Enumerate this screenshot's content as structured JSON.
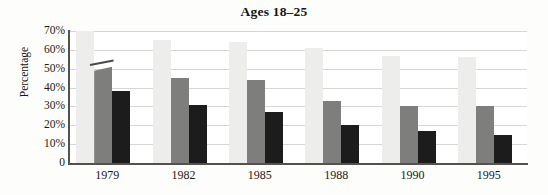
{
  "chart_data": {
    "type": "bar",
    "title": "Ages 18–25",
    "xlabel": "",
    "ylabel": "Percentage",
    "categories": [
      "1979",
      "1982",
      "1985",
      "1988",
      "1990",
      "1995"
    ],
    "ylim": [
      0,
      70
    ],
    "ytick_values": [
      70,
      60,
      50,
      40,
      30,
      20,
      10,
      0
    ],
    "ytick_labels": [
      "70%",
      "60%",
      "50%",
      "40%",
      "30%",
      "20%",
      "10%",
      "0"
    ],
    "grid": true,
    "legend": "none",
    "series": [
      {
        "name": "series-1",
        "color": "#ededeb",
        "values": [
          72,
          65,
          64,
          61,
          57,
          56
        ]
      },
      {
        "name": "series-2",
        "color": "#7e7e7c",
        "values": [
          51,
          45,
          44,
          33,
          30,
          30
        ]
      },
      {
        "name": "series-3",
        "color": "#1c1c1c",
        "values": [
          38,
          31,
          27,
          20,
          17,
          15
        ]
      }
    ]
  }
}
